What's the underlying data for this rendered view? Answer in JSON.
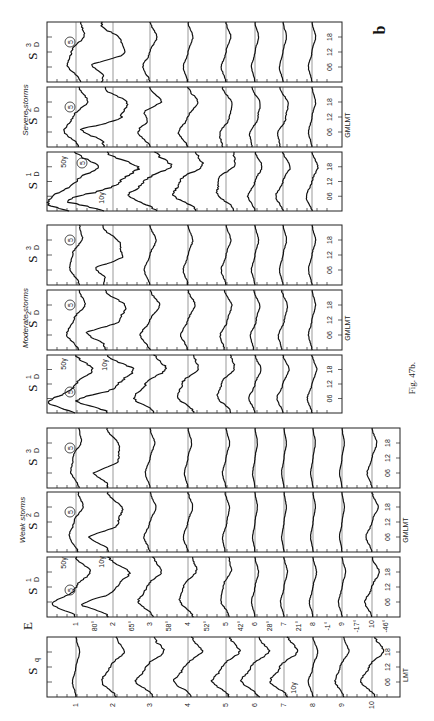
{
  "figure": {
    "label": "b",
    "caption": "Fig. 47b.",
    "rotated": "90deg counter-clockwise (time axis vertical, stations horizontal)"
  },
  "chart_data": {
    "type": "line",
    "groups": [
      {
        "name": "Severe storms",
        "panels": [
          {
            "label": "S_D^1",
            "symbol": "S",
            "sup": "1",
            "sub": "D",
            "time_axis": "GM/LMT",
            "scale_notes": [
              "50γ",
              "10γ"
            ]
          },
          {
            "label": "S_D^2",
            "symbol": "S",
            "sup": "2",
            "sub": "D",
            "time_axis": "GMLMT",
            "scale_notes": []
          },
          {
            "label": "S_D^3",
            "symbol": "S",
            "sup": "3",
            "sub": "D",
            "time_axis": "",
            "scale_notes": []
          }
        ]
      },
      {
        "name": "Moderate storms",
        "panels": [
          {
            "label": "S_D^1",
            "symbol": "S",
            "sup": "1",
            "sub": "D",
            "time_axis": "",
            "scale_notes": [
              "50γ",
              "10γ"
            ]
          },
          {
            "label": "S_D^2",
            "symbol": "S",
            "sup": "2",
            "sub": "D",
            "time_axis": "GMLMT",
            "scale_notes": []
          },
          {
            "label": "S_D^3",
            "symbol": "S",
            "sup": "3",
            "sub": "D",
            "time_axis": "",
            "scale_notes": []
          }
        ]
      },
      {
        "name": "Weak storms",
        "panels": [
          {
            "label": "S_D^1",
            "symbol": "S",
            "sup": "1",
            "sub": "D",
            "time_axis": "",
            "scale_notes": [
              "50γ",
              "10γ"
            ]
          },
          {
            "label": "S_D^2",
            "symbol": "S",
            "sup": "2",
            "sub": "D",
            "time_axis": "GMLMT",
            "scale_notes": []
          },
          {
            "label": "S_D^3",
            "symbol": "S",
            "sup": "3",
            "sub": "D",
            "time_axis": "",
            "scale_notes": []
          }
        ]
      },
      {
        "name": "Quiet day",
        "panels": [
          {
            "label": "Sq",
            "symbol": "S",
            "sup": "",
            "sub": "q",
            "time_axis": "LMT",
            "scale_notes": [
              "10γ"
            ]
          }
        ]
      }
    ],
    "component": "E",
    "stations": [
      "1",
      "2",
      "3",
      "4",
      "5",
      "6",
      "7",
      "8",
      "9",
      "10"
    ],
    "geomagnetic_latitudes": [
      "80°",
      "65°",
      "58°",
      "52°",
      "42°",
      "28°",
      "21°",
      "-1°",
      "-17°",
      "-46°"
    ],
    "time_ticks": [
      "06",
      "12",
      "18"
    ],
    "circled_marker": "5",
    "xlabel": "Station (geomagnetic latitude)",
    "ylabel": "Hour (GMLMT / LMT)",
    "grid": false
  },
  "labels": {
    "e_component": "E",
    "severe_title": "Severe storms",
    "moderate_title": "Moderate storms",
    "weak_title": "Weak storms",
    "gmlmt": "GMLMT",
    "lmt": "LMT",
    "s_symbol": "S",
    "sub_d": "D",
    "sub_q": "q",
    "sup1": "1",
    "sup2": "2",
    "sup3": "3",
    "g50": "50γ",
    "g10": "10γ",
    "circle": "5",
    "t06": "06",
    "t12": "12",
    "t18": "18",
    "fig_caption": "Fig. 47b.",
    "fig_letter": "b"
  }
}
